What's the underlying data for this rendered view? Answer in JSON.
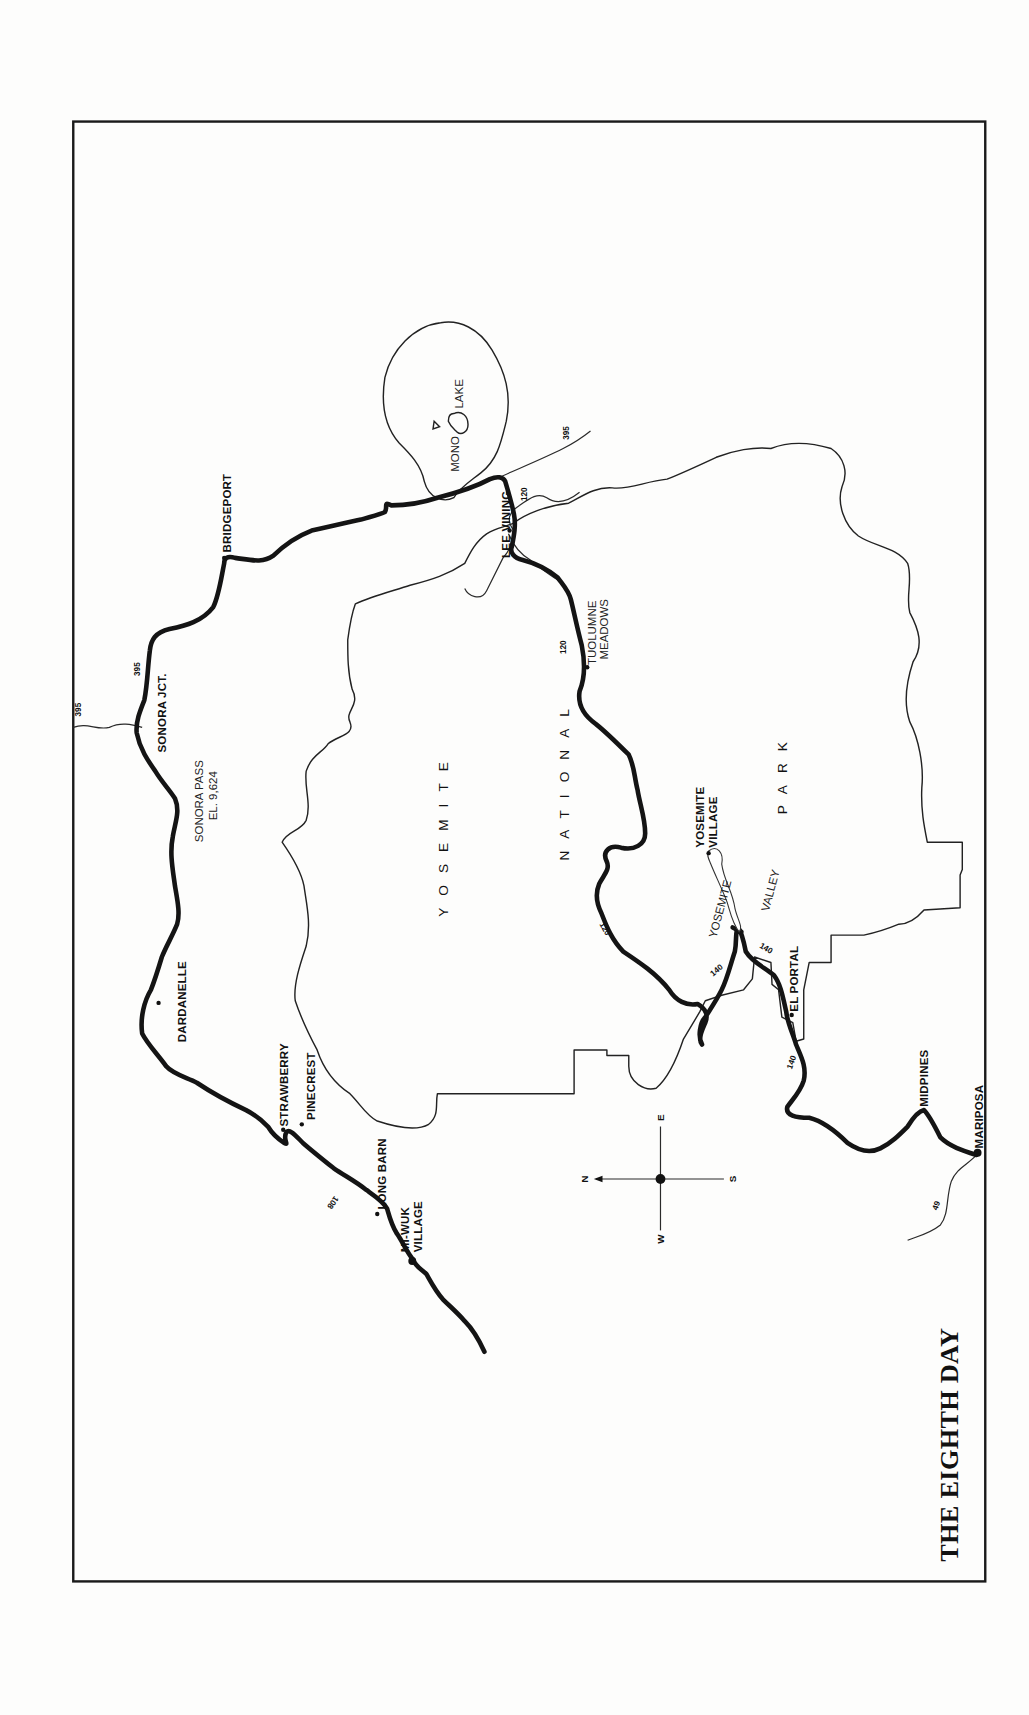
{
  "map": {
    "title": "THE EIGHTH DAY",
    "orientation": "rotated 90° counter-clockwise (north points left)",
    "colors": {
      "ink": "#141414",
      "paper": "#fdfdfc"
    },
    "regions": {
      "park_words": [
        "YOSEMITE",
        "NATIONAL",
        "PARK"
      ],
      "lake": {
        "word1": "MONO",
        "word2": "LAKE"
      },
      "valley": {
        "word1": "YOSEMITE",
        "word2": "VALLEY"
      }
    },
    "places": {
      "bridgeport": "BRIDGEPORT",
      "sonora_jct": "SONORA JCT.",
      "sonora_pass_line1": "SONORA PASS",
      "sonora_pass_line2": "EL. 9,624",
      "dardanelle": "DARDANELLE",
      "strawberry": "STRAWBERRY",
      "pinecrest": "PINECREST",
      "long_barn": "LONG BARN",
      "miwuk_line1": "MI-WUK",
      "miwuk_line2": "VILLAGE",
      "lee_vining": "LEE VINING",
      "tuolumne_line1": "TUOLUMNE",
      "tuolumne_line2": "MEADOWS",
      "yosemite_village_line1": "YOSEMITE",
      "yosemite_village_line2": "VILLAGE",
      "el_portal": "EL PORTAL",
      "midpines": "MIDPINES",
      "mariposa": "MARIPOSA"
    },
    "highways": {
      "h395_north": "395",
      "h395_route": "395",
      "h395_south": "395",
      "h120_lee": "120",
      "h120_tuolumne": "120",
      "h120_west": "120",
      "h140_valley": "140",
      "h140_elportal": "140",
      "h140_south": "140",
      "h108": "108",
      "h49": "49"
    },
    "compass": {
      "north": "N",
      "south": "S",
      "east": "E",
      "west": "W"
    }
  }
}
